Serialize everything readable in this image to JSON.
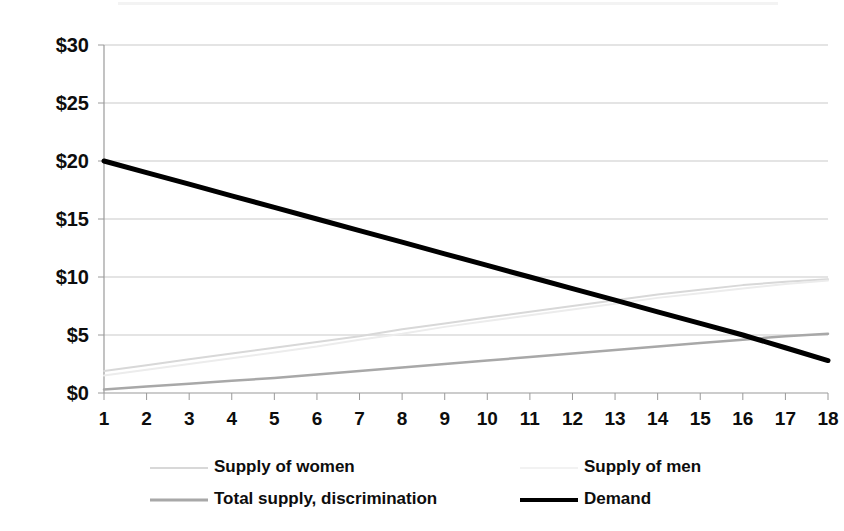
{
  "chart_data": {
    "type": "line",
    "title": "",
    "subtitle": "",
    "xlabel": "",
    "ylabel": "",
    "x": [
      1,
      2,
      3,
      4,
      5,
      6,
      7,
      8,
      9,
      10,
      11,
      12,
      13,
      14,
      15,
      16,
      17,
      18
    ],
    "categories": [
      "1",
      "2",
      "3",
      "4",
      "5",
      "6",
      "7",
      "8",
      "9",
      "10",
      "11",
      "12",
      "13",
      "14",
      "15",
      "16",
      "17",
      "18"
    ],
    "xlim": [
      1,
      18
    ],
    "ylim": [
      0,
      30
    ],
    "y_ticks": [
      0,
      5,
      10,
      15,
      20,
      25,
      30
    ],
    "y_tick_labels": [
      "$0",
      "$5",
      "$10",
      "$15",
      "$20",
      "$25",
      "$30"
    ],
    "grid": true,
    "grid_axis": "y",
    "legend_position": "bottom",
    "series": [
      {
        "name": "Supply of women",
        "color": "#d8d8d8",
        "width": 2,
        "values": [
          1.9,
          2.4,
          2.9,
          3.4,
          3.9,
          4.4,
          4.9,
          5.5,
          6.0,
          6.5,
          7.0,
          7.5,
          8.0,
          8.5,
          8.9,
          9.3,
          9.6,
          9.8
        ]
      },
      {
        "name": "Supply of men",
        "color": "#ececec",
        "width": 2,
        "values": [
          1.5,
          2.0,
          2.5,
          3.0,
          3.5,
          4.0,
          4.6,
          5.1,
          5.7,
          6.2,
          6.7,
          7.2,
          7.7,
          8.2,
          8.6,
          9.0,
          9.4,
          9.7
        ]
      },
      {
        "name": "Total supply, discrimination",
        "color": "#a8a8a8",
        "width": 2.5,
        "values": [
          0.3,
          0.55,
          0.8,
          1.05,
          1.3,
          1.6,
          1.9,
          2.2,
          2.5,
          2.8,
          3.1,
          3.4,
          3.7,
          4.0,
          4.3,
          4.6,
          4.9,
          5.1
        ]
      },
      {
        "name": "Demand",
        "color": "#000000",
        "width": 5,
        "values": [
          20.0,
          19.0,
          18.0,
          17.0,
          16.0,
          15.0,
          14.0,
          13.0,
          12.0,
          11.0,
          10.0,
          9.0,
          8.0,
          7.0,
          6.0,
          5.0,
          3.9,
          2.8
        ]
      }
    ],
    "legend": [
      {
        "label": "Supply of women",
        "color": "#d8d8d8",
        "width": 2,
        "column": 0,
        "row": 0
      },
      {
        "label": "Supply of men",
        "color": "#f2f2f2",
        "width": 2,
        "column": 1,
        "row": 0
      },
      {
        "label": "Total supply, discrimination",
        "color": "#a8a8a8",
        "width": 3,
        "column": 0,
        "row": 1
      },
      {
        "label": "Demand",
        "color": "#000000",
        "width": 4,
        "column": 1,
        "row": 1
      }
    ]
  }
}
